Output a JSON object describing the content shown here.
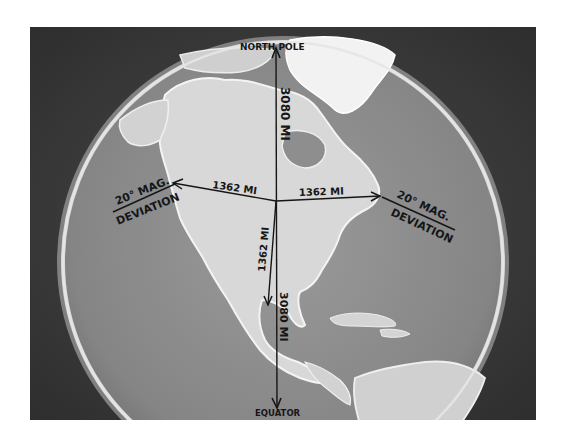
{
  "figure": {
    "colors": {
      "space": "#3a3a3a",
      "ocean": "#8a8a8a",
      "land": "#d6d6d6",
      "ice": "#f4f4f4",
      "rim": "#cfcfcf",
      "ink": "#161616",
      "border": "#ffffff"
    }
  },
  "labels": {
    "north_pole": "NORTH POLE",
    "equator": "EQUATOR",
    "north_distance": "3080 MI",
    "south_distance": "3080 MI",
    "west_distance": "1362 MI",
    "east_distance": "1362 MI",
    "down_distance": "1362 MI",
    "west_deviation_line1": "20° MAG.",
    "west_deviation_line2": "DEVIATION",
    "east_deviation_line1": "20° MAG.",
    "east_deviation_line2": "DEVIATION"
  }
}
